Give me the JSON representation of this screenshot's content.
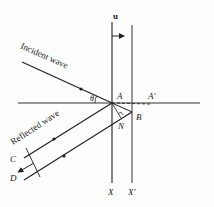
{
  "diagram": {
    "labels": {
      "velocity": "u",
      "incident": "Incident wave",
      "reflected": "Reflected wave",
      "angle": "θ",
      "A": "A",
      "A_prime": "A′",
      "B": "B",
      "N": "N",
      "C": "C",
      "D": "D",
      "X": "X",
      "X_prime": "X′"
    },
    "colors": {
      "line": "#222222",
      "background": "#fdfdfd"
    }
  }
}
